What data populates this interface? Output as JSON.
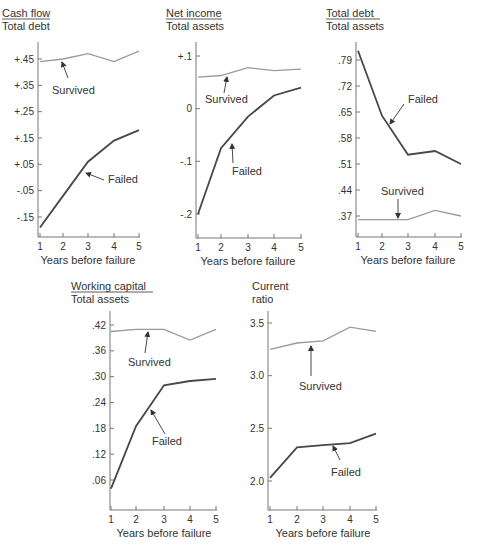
{
  "figure": {
    "x_axis_label": "Years before failure",
    "series_labels": {
      "survived": "Survived",
      "failed": "Failed"
    },
    "colors": {
      "survived": "#9a9a9a",
      "failed": "#474747",
      "axis": "#777777",
      "text": "#333333"
    }
  },
  "chart_data": [
    {
      "type": "line",
      "title": "Cash flow / Total debt",
      "title_num": "Cash flow",
      "title_den": "Total debt",
      "xlabel": "Years before failure",
      "x": [
        1,
        2,
        3,
        4,
        5
      ],
      "yticks": [
        "+.45",
        "+.35",
        "+.25",
        "+.15",
        "+.05",
        "-.05",
        "-.15"
      ],
      "ytick_values": [
        0.45,
        0.35,
        0.25,
        0.15,
        0.05,
        -0.05,
        -0.15
      ],
      "series": [
        {
          "name": "Survived",
          "values": [
            0.44,
            0.45,
            0.47,
            0.44,
            0.48
          ]
        },
        {
          "name": "Failed",
          "values": [
            -0.19,
            -0.07,
            0.06,
            0.14,
            0.18
          ]
        }
      ]
    },
    {
      "type": "line",
      "title": "Net income / Total assets",
      "title_num": "Net income",
      "title_den": "Total assets",
      "xlabel": "Years before failure",
      "x": [
        1,
        2,
        3,
        4,
        5
      ],
      "yticks": [
        "+.1",
        "0",
        "-.1",
        "-.2"
      ],
      "ytick_values": [
        0.1,
        0.0,
        -0.1,
        -0.2
      ],
      "series": [
        {
          "name": "Survived",
          "values": [
            0.06,
            0.063,
            0.078,
            0.072,
            0.075
          ]
        },
        {
          "name": "Failed",
          "values": [
            -0.2,
            -0.075,
            -0.015,
            0.025,
            0.04
          ]
        }
      ]
    },
    {
      "type": "line",
      "title": "Total debt / Total assets",
      "title_num": "Total debt",
      "title_den": "Total assets",
      "xlabel": "Years before failure",
      "x": [
        1,
        2,
        3,
        4,
        5
      ],
      "yticks": [
        ".79",
        ".72",
        ".65",
        ".58",
        ".51",
        ".44",
        ".37"
      ],
      "ytick_values": [
        0.79,
        0.72,
        0.65,
        0.58,
        0.51,
        0.44,
        0.37
      ],
      "series": [
        {
          "name": "Survived",
          "values": [
            0.36,
            0.36,
            0.36,
            0.385,
            0.37
          ]
        },
        {
          "name": "Failed",
          "values": [
            0.815,
            0.64,
            0.535,
            0.545,
            0.51
          ]
        }
      ]
    },
    {
      "type": "line",
      "title": "Working capital / Total assets",
      "title_num": "Working capital",
      "title_den": "Total assets",
      "xlabel": "Years before failure",
      "x": [
        1,
        2,
        3,
        4,
        5
      ],
      "yticks": [
        ".42",
        ".36",
        ".30",
        ".24",
        ".18",
        ".12",
        ".06"
      ],
      "ytick_values": [
        0.42,
        0.36,
        0.3,
        0.24,
        0.18,
        0.12,
        0.06
      ],
      "series": [
        {
          "name": "Survived",
          "values": [
            0.405,
            0.41,
            0.41,
            0.385,
            0.41
          ]
        },
        {
          "name": "Failed",
          "values": [
            0.04,
            0.185,
            0.28,
            0.29,
            0.295
          ]
        }
      ]
    },
    {
      "type": "line",
      "title": "Current ratio",
      "title_num": "Current",
      "title_den": "ratio",
      "xlabel": "Years before failure",
      "x": [
        1,
        2,
        3,
        4,
        5
      ],
      "yticks": [
        "3.5",
        "3.0",
        "2.5",
        "2.0"
      ],
      "ytick_values": [
        3.5,
        3.0,
        2.5,
        2.0
      ],
      "series": [
        {
          "name": "Survived",
          "values": [
            3.25,
            3.31,
            3.33,
            3.46,
            3.42
          ]
        },
        {
          "name": "Failed",
          "values": [
            2.03,
            2.32,
            2.34,
            2.36,
            2.45
          ]
        }
      ]
    }
  ]
}
